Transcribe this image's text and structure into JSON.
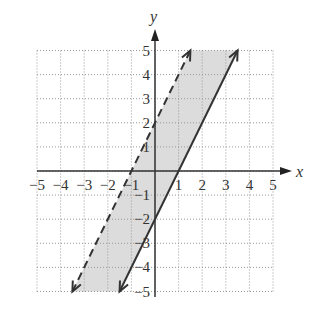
{
  "chart_data": {
    "type": "line",
    "title": "",
    "xlabel": "x",
    "ylabel": "y",
    "xlim": [
      -5,
      5
    ],
    "ylim": [
      -5,
      5
    ],
    "grid": true,
    "x_ticks": [
      "-5",
      "-4",
      "-3",
      "-2",
      "-1",
      "1",
      "2",
      "3",
      "4",
      "5"
    ],
    "y_ticks": [
      "5",
      "4",
      "3",
      "2",
      "1",
      "-1",
      "-2",
      "-3",
      "-4",
      "-5"
    ],
    "series": [
      {
        "name": "y = 2x + 2",
        "style": "dashed",
        "points": [
          [
            -3.5,
            -5
          ],
          [
            1.5,
            5
          ]
        ]
      },
      {
        "name": "y = 2x - 2",
        "style": "solid",
        "points": [
          [
            -1.5,
            -5
          ],
          [
            3.5,
            5
          ]
        ]
      }
    ],
    "shaded_region": "between the two lines (2x - 2 <= y < 2x + 2)",
    "colors": {
      "shade": "#dcdcdc",
      "line": "#333333",
      "grid": "#999999"
    }
  }
}
